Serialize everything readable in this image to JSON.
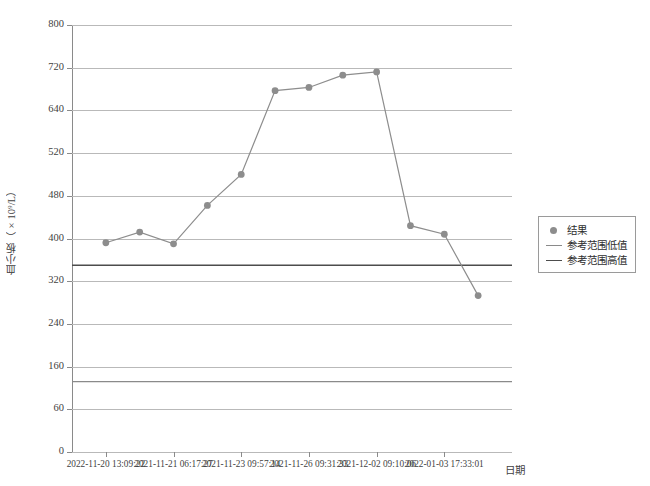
{
  "chart_data": {
    "type": "line",
    "title": "",
    "xlabel": "日期",
    "ylabel": "血小板（×10⁹/L）",
    "grid": true,
    "legend_position": "right",
    "ylim": [
      0,
      800
    ],
    "y_ticks": [
      0,
      60,
      160,
      240,
      320,
      400,
      480,
      520,
      640,
      720,
      800
    ],
    "x_tick_labels": [
      "2022-11-20 13:09:22",
      "2021-11-21 06:17:27",
      "2021-11-23 09:57:14",
      "2021-11-26 09:31:33",
      "2021-12-02 09:10:06",
      "2022-01-03 17:33:01"
    ],
    "x": [
      0,
      1,
      2,
      3,
      4,
      5,
      6,
      7,
      8,
      9,
      10,
      11
    ],
    "series": [
      {
        "name": "结果",
        "color": "#8d8d8d",
        "marker": "circle",
        "values": [
          392,
          412,
          390,
          462,
          500,
          677,
          683,
          706,
          712,
          424,
          408,
          293
        ]
      },
      {
        "name": "参考范围低值",
        "color": "#8a8a8a",
        "type": "hline",
        "value": 125
      },
      {
        "name": "参考范围高值",
        "color": "#4d4d4d",
        "type": "hline",
        "value": 350
      }
    ]
  },
  "legend": {
    "items": [
      {
        "label": "结果",
        "swatch": "marker-dot",
        "color": "#8d8d8d"
      },
      {
        "label": "参考范围低值",
        "swatch": "line",
        "color": "#8a8a8a"
      },
      {
        "label": "参考范围高值",
        "swatch": "line",
        "color": "#4d4d4d"
      }
    ]
  },
  "axes": {
    "y_title": "血小板（×10⁹/L）",
    "x_title": "日期"
  }
}
